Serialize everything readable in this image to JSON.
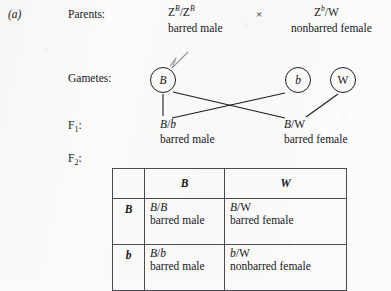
{
  "figure": {
    "panel_letter": "(a)"
  },
  "rows": {
    "parents_label": "Parents:",
    "gametes_label": "Gametes:",
    "f1_label": "F₁:",
    "f2_label": "F₂:"
  },
  "parents": {
    "left": {
      "genotype_base": "Z",
      "genotype_sup1": "B",
      "genotype_mid": "/Z",
      "genotype_sup2": "B",
      "phenotype": "barred male"
    },
    "cross_symbol": "×",
    "right": {
      "genotype_base": "Z",
      "genotype_sup1": "b",
      "genotype_rest": "/W",
      "phenotype": "nonbarred female"
    }
  },
  "gametes": [
    {
      "label": "B",
      "italic": true
    },
    {
      "label": "b",
      "italic": true
    },
    {
      "label": "W",
      "italic": false
    }
  ],
  "f1": {
    "left": {
      "genotype_a": "B",
      "genotype_slash": "/",
      "genotype_b": "b",
      "phenotype": "barred male"
    },
    "right": {
      "genotype_a": "B",
      "genotype_slash": "/",
      "genotype_b": "W",
      "phenotype": "barred female"
    }
  },
  "punnett": {
    "corner": "",
    "col_headers": [
      "B",
      "W"
    ],
    "row_headers": [
      "B",
      "b"
    ],
    "cells": [
      [
        {
          "genotype_a": "B",
          "slash": "/",
          "genotype_b": "B",
          "phenotype": "barred male"
        },
        {
          "genotype_a": "B",
          "slash": "/",
          "genotype_b": "W",
          "phenotype": "barred female"
        }
      ],
      [
        {
          "genotype_a": "B",
          "slash": "/",
          "genotype_b": "b",
          "phenotype": "barred male"
        },
        {
          "genotype_a": "b",
          "slash": "/",
          "genotype_b": "W",
          "phenotype": "nonbarred female"
        }
      ]
    ]
  },
  "colors": {
    "ink": "#17171a",
    "paper": "#fbfbfa",
    "rule": "#4a4a4e",
    "border": "#1d1d20"
  }
}
